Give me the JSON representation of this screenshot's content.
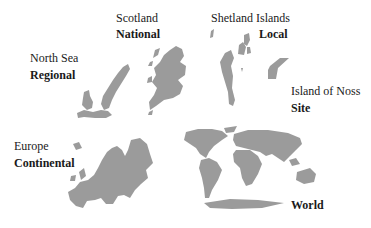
{
  "diagram": {
    "scales": [
      {
        "place": "Scotland",
        "scale": "National"
      },
      {
        "place": "Shetland Islands",
        "scale": "Local"
      },
      {
        "place": "North Sea",
        "scale": "Regional"
      },
      {
        "place": "Island of Noss",
        "scale": "Site"
      },
      {
        "place": "Europe",
        "scale": "Continental"
      },
      {
        "place": "",
        "scale": "World"
      }
    ],
    "colors": {
      "land": "#9b9b9b",
      "text": "#1a1a1a",
      "background": "#ffffff"
    }
  }
}
